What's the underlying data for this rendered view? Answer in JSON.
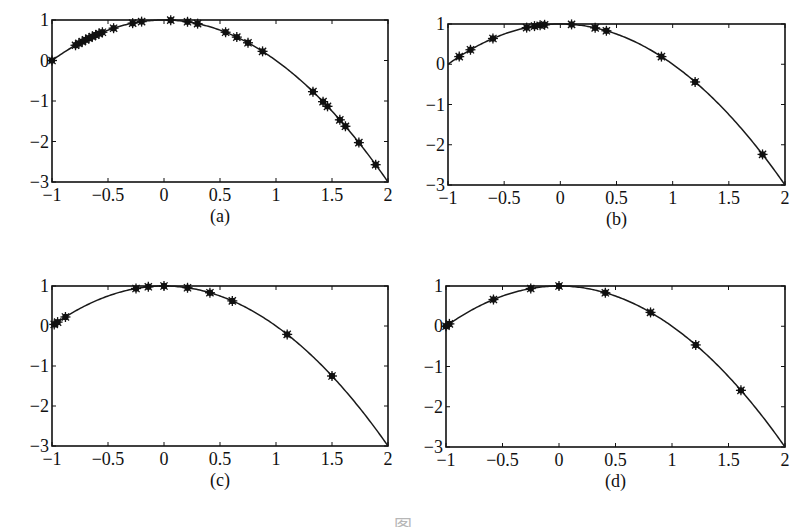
{
  "figure": {
    "caption": "图",
    "function": "y = 1 - x^2"
  },
  "chart_data": [
    {
      "type": "line",
      "panel_label": "(a)",
      "title": "",
      "xlabel": "",
      "ylabel": "",
      "xlim": [
        -1,
        2
      ],
      "ylim": [
        -3,
        1
      ],
      "xticks": [
        "-1",
        "-0.5",
        "0",
        "0.5",
        "1",
        "1.5",
        "2"
      ],
      "yticks": [
        "1",
        "0",
        "-1",
        "-2",
        "-3"
      ],
      "grid": false,
      "legend": null,
      "series": [
        {
          "name": "curve",
          "function": "1 - x^2",
          "style": "solid line"
        },
        {
          "name": "nodes",
          "style": "star markers",
          "x": [
            -1.0,
            -0.79,
            -0.76,
            -0.73,
            -0.7,
            -0.67,
            -0.64,
            -0.61,
            -0.58,
            -0.55,
            -0.45,
            -0.28,
            -0.2,
            0.06,
            0.21,
            0.3,
            0.55,
            0.65,
            0.75,
            0.88,
            1.33,
            1.42,
            1.46,
            1.57,
            1.62,
            1.74,
            1.89
          ]
        }
      ]
    },
    {
      "type": "line",
      "panel_label": "(b)",
      "title": "",
      "xlabel": "",
      "ylabel": "",
      "xlim": [
        -1,
        2
      ],
      "ylim": [
        -3,
        1
      ],
      "xticks": [
        "-1",
        "-0.5",
        "0",
        "0.5",
        "1",
        "1.5",
        "2"
      ],
      "yticks": [
        "1",
        "0",
        "-1",
        "-2",
        "-3"
      ],
      "grid": false,
      "legend": null,
      "series": [
        {
          "name": "curve",
          "function": "1 - x^2",
          "style": "solid line"
        },
        {
          "name": "nodes",
          "style": "star markers",
          "x": [
            -0.9,
            -0.8,
            -0.6,
            -0.3,
            -0.23,
            -0.18,
            -0.14,
            0.1,
            0.31,
            0.41,
            0.9,
            1.2,
            1.8
          ]
        }
      ]
    },
    {
      "type": "line",
      "panel_label": "(c)",
      "title": "",
      "xlabel": "",
      "ylabel": "",
      "xlim": [
        -1,
        2
      ],
      "ylim": [
        -3,
        1
      ],
      "xticks": [
        "-1",
        "-0.5",
        "0",
        "0.5",
        "1",
        "1.5",
        "2"
      ],
      "yticks": [
        "1",
        "0",
        "-1",
        "-2",
        "-3"
      ],
      "grid": false,
      "legend": null,
      "series": [
        {
          "name": "curve",
          "function": "1 - x^2",
          "style": "solid line"
        },
        {
          "name": "nodes",
          "style": "star markers",
          "x": [
            -0.98,
            -0.95,
            -0.88,
            -0.25,
            -0.14,
            0.0,
            0.21,
            0.41,
            0.61,
            1.1,
            1.5
          ]
        }
      ]
    },
    {
      "type": "line",
      "panel_label": "(d)",
      "title": "",
      "xlabel": "",
      "ylabel": "",
      "xlim": [
        -1,
        2
      ],
      "ylim": [
        -3,
        1
      ],
      "xticks": [
        "-1",
        "-0.5",
        "0",
        "0.5",
        "1",
        "1.5",
        "2"
      ],
      "yticks": [
        "1",
        "0",
        "-1",
        "-2",
        "-3"
      ],
      "grid": false,
      "legend": null,
      "series": [
        {
          "name": "curve",
          "function": "1 - x^2",
          "style": "solid line"
        },
        {
          "name": "nodes",
          "style": "star markers",
          "x": [
            -1.0,
            -0.97,
            -0.58,
            -0.25,
            0.0,
            0.41,
            0.81,
            1.21,
            1.61
          ]
        }
      ]
    }
  ],
  "layout": {
    "panels": [
      {
        "left": 52,
        "top": 20,
        "right": 388,
        "bottom": 182
      },
      {
        "left": 448,
        "top": 24,
        "right": 785,
        "bottom": 185
      },
      {
        "left": 52,
        "top": 286,
        "right": 388,
        "bottom": 446
      },
      {
        "left": 446,
        "top": 286,
        "right": 785,
        "bottom": 447
      }
    ],
    "line_color": "#1a1a1a",
    "marker_color": "#111111"
  }
}
